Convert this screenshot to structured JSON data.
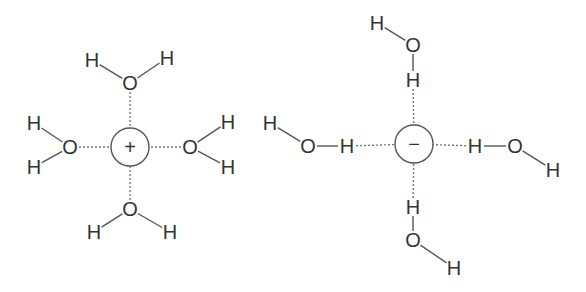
{
  "diagram": {
    "colors": {
      "text": "#333333",
      "bond": "#555555",
      "hbond": "#777777",
      "background": "#ffffff"
    },
    "cation": {
      "symbol": "+",
      "center": [
        130,
        147
      ],
      "radius": 19,
      "waters": [
        {
          "position": "top",
          "O": {
            "label": "O",
            "xy": [
              130,
              83
            ]
          },
          "H1": {
            "label": "H",
            "xy": [
              92,
              60
            ]
          },
          "H2": {
            "label": "H",
            "xy": [
              167,
              58
            ]
          }
        },
        {
          "position": "left",
          "O": {
            "label": "O",
            "xy": [
              70,
              147
            ]
          },
          "H1": {
            "label": "H",
            "xy": [
              34,
              123
            ]
          },
          "H2": {
            "label": "H",
            "xy": [
              34,
              167
            ]
          }
        },
        {
          "position": "right",
          "O": {
            "label": "O",
            "xy": [
              190,
              147
            ]
          },
          "H1": {
            "label": "H",
            "xy": [
              228,
              122
            ]
          },
          "H2": {
            "label": "H",
            "xy": [
              228,
              167
            ]
          }
        },
        {
          "position": "bottom",
          "O": {
            "label": "O",
            "xy": [
              130,
              209
            ]
          },
          "H1": {
            "label": "H",
            "xy": [
              94,
              232
            ]
          },
          "H2": {
            "label": "H",
            "xy": [
              170,
              232
            ]
          }
        }
      ]
    },
    "anion": {
      "symbol": "−",
      "center": [
        414,
        144
      ],
      "radius": 19,
      "waters": [
        {
          "position": "top",
          "Hnear": {
            "label": "H",
            "xy": [
              413,
              80
            ]
          },
          "O": {
            "label": "O",
            "xy": [
              413,
              45
            ]
          },
          "Hfar": {
            "label": "H",
            "xy": [
              377,
              23
            ]
          }
        },
        {
          "position": "left",
          "Hnear": {
            "label": "H",
            "xy": [
              347,
              146
            ]
          },
          "O": {
            "label": "O",
            "xy": [
              308,
              146
            ]
          },
          "Hfar": {
            "label": "H",
            "xy": [
              270,
              123
            ]
          }
        },
        {
          "position": "right",
          "Hnear": {
            "label": "H",
            "xy": [
              475,
              146
            ]
          },
          "O": {
            "label": "O",
            "xy": [
              515,
              146
            ]
          },
          "Hfar": {
            "label": "H",
            "xy": [
              553,
              170
            ]
          }
        },
        {
          "position": "bottom",
          "Hnear": {
            "label": "H",
            "xy": [
              413,
              207
            ]
          },
          "O": {
            "label": "O",
            "xy": [
              413,
              240
            ]
          },
          "Hfar": {
            "label": "H",
            "xy": [
              454,
              268
            ]
          }
        }
      ]
    }
  }
}
